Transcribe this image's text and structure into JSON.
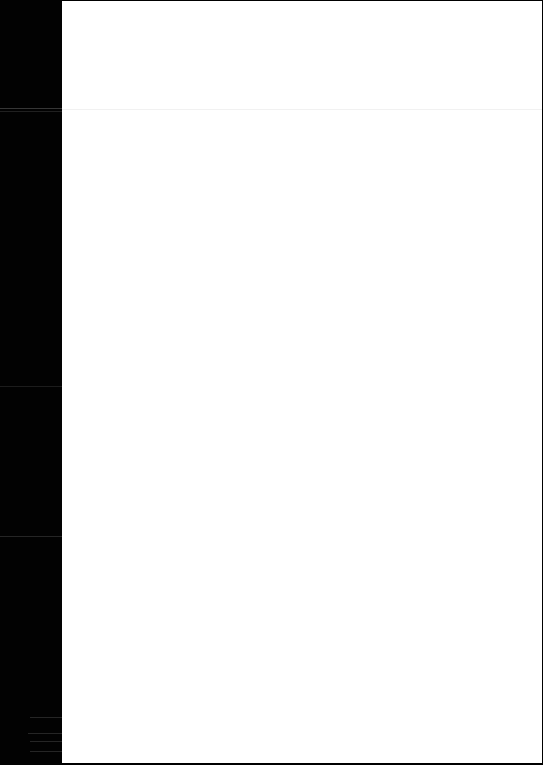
{
  "window": {
    "background_color": "#000000",
    "page_color": "#ffffff",
    "separator_color": "#f1f1f1"
  },
  "page": {
    "state": "blank",
    "header_text": "",
    "body_text": ""
  }
}
